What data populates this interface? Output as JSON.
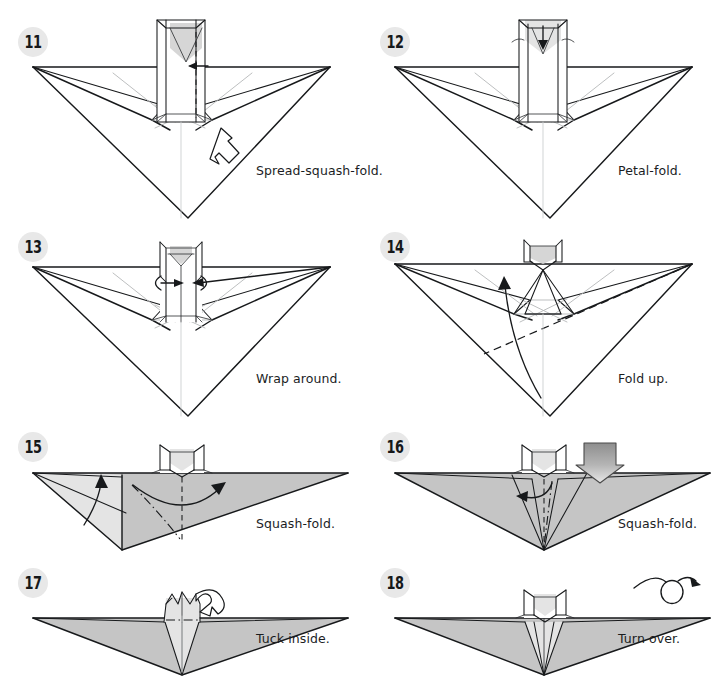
{
  "page": {
    "background_color": "#ffffff",
    "ink_color": "#17191b",
    "paper_shade_color": "#d6d6d6",
    "badge_background_color": "#e8e8e8",
    "columns": 2,
    "rows": 4
  },
  "steps": [
    {
      "number": "11",
      "caption": "Spread-squash-fold.",
      "symbols": [
        "spread-squash-arrow",
        "valley-fold-line",
        "small-left-arrow"
      ],
      "figure": "wide-v-shape-with-central-tube"
    },
    {
      "number": "12",
      "caption": "Petal-fold.",
      "symbols": [
        "down-arrow",
        "petal-fold-arcs"
      ],
      "figure": "wide-v-shape-with-central-tube"
    },
    {
      "number": "13",
      "caption": "Wrap around.",
      "symbols": [
        "wrap-around-arrows",
        "left-arrow",
        "right-arrow"
      ],
      "figure": "wide-v-shape-with-central-tube"
    },
    {
      "number": "14",
      "caption": "Fold up.",
      "symbols": [
        "fold-up-arrow",
        "valley-fold-line"
      ],
      "figure": "wide-v-shape-with-central-tube"
    },
    {
      "number": "15",
      "caption": "Squash-fold.",
      "symbols": [
        "up-arrow",
        "curved-right-arrow",
        "mountain-fold-line",
        "valley-fold-line"
      ],
      "figure": "flattened-wing-shaded"
    },
    {
      "number": "16",
      "caption": "Squash-fold.",
      "symbols": [
        "push-here-arrow",
        "curved-left-arrow",
        "mountain-fold-line",
        "valley-fold-line"
      ],
      "figure": "flattened-wing-shaded"
    },
    {
      "number": "17",
      "caption": "Tuck inside.",
      "symbols": [
        "tuck-arrow",
        "mountain-fold-line"
      ],
      "figure": "flattened-wing-shaded"
    },
    {
      "number": "18",
      "caption": "Turn over.",
      "symbols": [
        "turn-over-loop-arrow"
      ],
      "figure": "flattened-wing-shaded"
    }
  ]
}
